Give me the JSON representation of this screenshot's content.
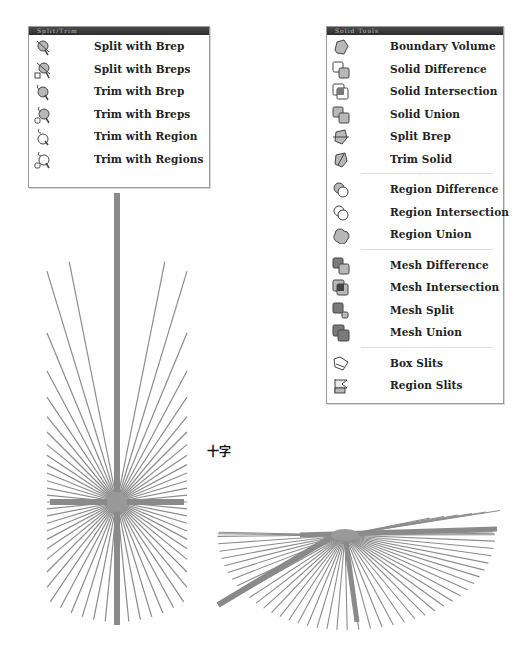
{
  "toolbar_split_trim": {
    "title": "Split/Trim",
    "items": [
      {
        "label": "Split with Brep",
        "icon": "split-brep-icon"
      },
      {
        "label": "Split with Breps",
        "icon": "split-breps-icon"
      },
      {
        "label": "Trim with Brep",
        "icon": "trim-brep-icon"
      },
      {
        "label": "Trim with Breps",
        "icon": "trim-breps-icon"
      },
      {
        "label": "Trim with Region",
        "icon": "trim-region-icon"
      },
      {
        "label": "Trim with Regions",
        "icon": "trim-regions-icon"
      }
    ]
  },
  "toolbar_solid_tools": {
    "title": "Solid Tools",
    "groups": [
      [
        {
          "label": "Boundary Volume",
          "icon": "boundary-volume-icon"
        },
        {
          "label": "Solid Difference",
          "icon": "solid-difference-icon"
        },
        {
          "label": "Solid Intersection",
          "icon": "solid-intersection-icon"
        },
        {
          "label": "Solid Union",
          "icon": "solid-union-icon"
        },
        {
          "label": "Split Brep",
          "icon": "split-brep-icon"
        },
        {
          "label": "Trim Solid",
          "icon": "trim-solid-icon"
        }
      ],
      [
        {
          "label": "Region Difference",
          "icon": "region-difference-icon"
        },
        {
          "label": "Region Intersection",
          "icon": "region-intersection-icon"
        },
        {
          "label": "Region Union",
          "icon": "region-union-icon"
        }
      ],
      [
        {
          "label": "Mesh Difference",
          "icon": "mesh-difference-icon"
        },
        {
          "label": "Mesh Intersection",
          "icon": "mesh-intersection-icon"
        },
        {
          "label": "Mesh Split",
          "icon": "mesh-split-icon"
        },
        {
          "label": "Mesh Union",
          "icon": "mesh-union-icon"
        }
      ],
      [
        {
          "label": "Box Slits",
          "icon": "box-slits-icon"
        },
        {
          "label": "Region Slits",
          "icon": "region-slits-icon"
        }
      ]
    ]
  },
  "caption": "十字",
  "colors": {
    "stroke": "#8c8c8c",
    "thick_stroke": "#8a8a8a",
    "text": "#222222",
    "titlebar": "#333333"
  }
}
